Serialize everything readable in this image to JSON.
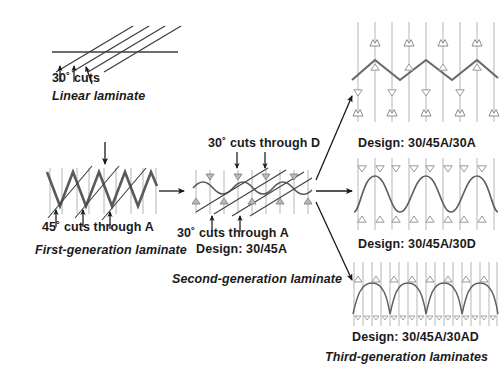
{
  "figure": {
    "title_absent": true,
    "background": "#ffffff",
    "line_color_dark": "#4a4a4a",
    "line_color_mid": "#6e6e6e",
    "line_color_light": "#b0b0b0",
    "text_color": "#1a1a1a"
  },
  "panels": [
    {
      "id": "linear-laminate",
      "type": "linear",
      "cut_label": "30˚ cuts",
      "cut_angle_deg": 30,
      "name_label": "Linear laminate",
      "arrow_count": 3,
      "diagonal_cut_count": 4,
      "ply_lines": 1
    },
    {
      "id": "first-generation-laminate",
      "type": "zigzag",
      "cut_label": "45˚ cuts through A",
      "cut_angle_deg": 45,
      "name_label": "First-generation laminate",
      "arrow_count": 3,
      "diagonal_cut_count": 3,
      "zigzag_periods": 4,
      "top_arrow": true
    },
    {
      "id": "second-generation-laminate",
      "type": "wave",
      "cut_label_top": "30˚ cuts through D",
      "cut_label_bottom": "30˚ cuts through A",
      "design_label": "Design: 30/45A",
      "name_label": "Second-generation laminate",
      "cut_angle_deg": 30,
      "diagonal_cut_count": 4,
      "wave_periods": 4,
      "top_arrow_count": 2,
      "bottom_arrow_count": 2
    }
  ],
  "third_generation": {
    "group_label": "Third-generation laminates",
    "variants": [
      {
        "id": "design-30-45A-30A",
        "design_label": "Design: 30/45A/30A",
        "pattern": "chevron",
        "periods": 4,
        "vertical_lines": 9
      },
      {
        "id": "design-30-45A-30D",
        "design_label": "Design: 30/45A/30D",
        "pattern": "sine",
        "periods": 4,
        "vertical_lines": 9
      },
      {
        "id": "design-30-45A-30AD",
        "design_label": "Design: 30/45A/30AD",
        "pattern": "arch",
        "periods": 8,
        "vertical_lines": 17
      }
    ]
  },
  "connectors": [
    {
      "id": "arrow-first-to-second",
      "direction": "right"
    },
    {
      "id": "arrow-second-to-design-a",
      "direction": "up-right"
    },
    {
      "id": "arrow-second-to-design-d",
      "direction": "right"
    },
    {
      "id": "arrow-second-to-design-ad",
      "direction": "down-right"
    }
  ]
}
